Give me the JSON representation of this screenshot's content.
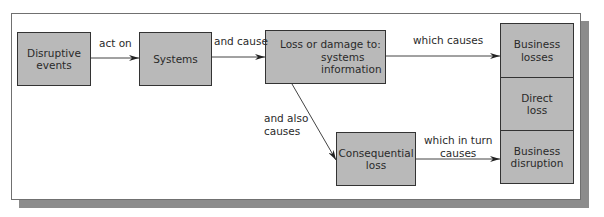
{
  "diagram": {
    "nodes": {
      "disruptive_events": "Disruptive\nevents",
      "systems": "Systems",
      "loss_damage_title": "Loss or damage to:",
      "loss_damage_items": "systems\ninformation",
      "business_losses": "Business\nlosses",
      "direct_loss": "Direct\nloss",
      "business_disruption": "Business\ndisruption",
      "consequential_loss": "Consequential\nloss"
    },
    "edges": {
      "act_on": "act on",
      "and_cause": "and cause",
      "which_causes": "which causes",
      "and_also_causes": "and also\ncauses",
      "which_in_turn_causes": "which in turn\ncauses"
    },
    "colors": {
      "box_fill": "#b9b9b9",
      "shadow": "#8c8c8c",
      "line": "#333333"
    }
  }
}
